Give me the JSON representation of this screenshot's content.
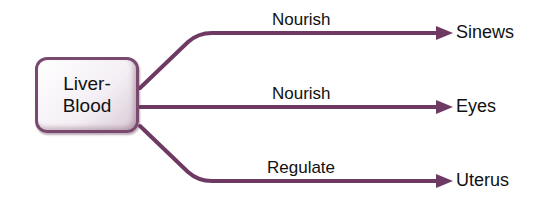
{
  "diagram": {
    "source": {
      "line1": "Liver-",
      "line2": "Blood"
    },
    "edges": [
      {
        "label": "Nourish",
        "target": "Sinews"
      },
      {
        "label": "Nourish",
        "target": "Eyes"
      },
      {
        "label": "Regulate",
        "target": "Uterus"
      }
    ],
    "colors": {
      "arrow": "#6e3a63",
      "box_border": "#7a4a6e"
    }
  }
}
